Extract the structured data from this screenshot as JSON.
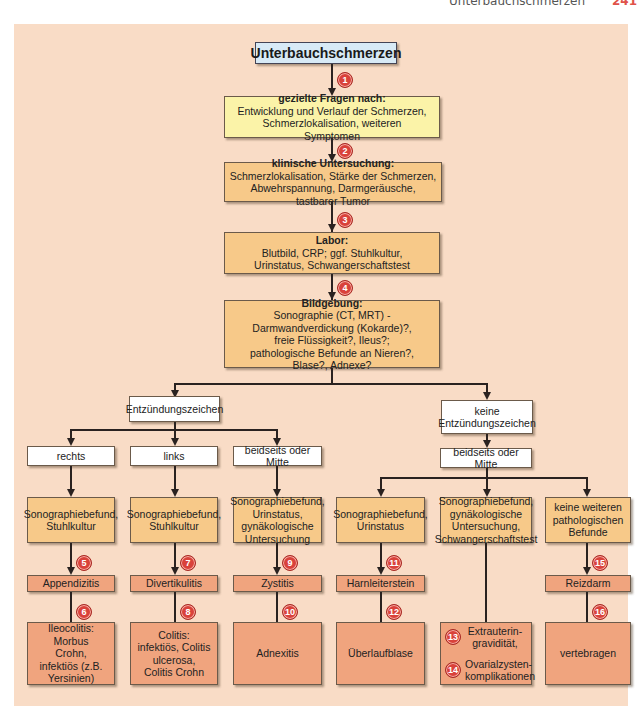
{
  "header": {
    "running_title": "Unterbauchschmerzen",
    "page_number": "241"
  },
  "flowchart": {
    "title": "Unterbauchschmerzen",
    "steps": [
      {
        "badge": "1",
        "heading": "gezielte Fragen nach:",
        "body": "Entwicklung und Verlauf der Schmerzen, Schmerzlokalisation, weiteren Symptomen"
      },
      {
        "badge": "2",
        "heading": "klinische Untersuchung:",
        "body": "Schmerzlokalisation, Stärke der Schmerzen, Abwehrspannung, Darmgeräusche, tastbarer Tumor"
      },
      {
        "badge": "3",
        "heading": "Labor:",
        "body": "Blutbild, CRP; ggf. Stuhlkultur, Urinstatus, Schwangerschaftstest"
      },
      {
        "badge": "4",
        "heading": "Bildgebung:",
        "body": "Sonographie (CT, MRT) - Darmwandverdickung (Kokarde)?, freie Flüssigkeit?, Ileus?; pathologische Befunde an Nieren?, Blase?, Adnexe?"
      }
    ],
    "branches": {
      "inflammation": "Entzündungszeichen",
      "no_inflammation": "keine Entzündungszeichen"
    },
    "locations": {
      "right": "rechts",
      "left": "links",
      "both_center_a": "beidseits oder Mitte",
      "both_center_b": "beidseits oder Mitte"
    },
    "findings": {
      "col1": "Sonographiebefund, Stuhlkultur",
      "col2": "Sonographiebefund, Stuhlkultur",
      "col3": "Sonographiebefund, Urinstatus, gynäkologische Untersuchung",
      "col4": "Sonographiebefund, Urinstatus",
      "col5": "Sonographiebefund, gynäkologische Untersuchung, Schwangerschaftstest",
      "col6": "keine weiteren pathologischen Befunde"
    },
    "diagnoses": {
      "col1": {
        "badge": "5",
        "label": "Appendizitis"
      },
      "col2": {
        "badge": "7",
        "label": "Divertikulitis"
      },
      "col3": {
        "badge": "9",
        "label": "Zystitis"
      },
      "col4": {
        "badge": "11",
        "label": "Harnleiterstein"
      },
      "col6": {
        "badge": "15",
        "label": "Reizdarm"
      }
    },
    "outcomes": {
      "col1": {
        "badge": "6",
        "label": "Ileocolitis: Morbus Crohn, infektiös (z.B. Yersinien)"
      },
      "col2": {
        "badge": "8",
        "label": "Colitis: infektiös, Colitis ulcerosa, Colitis Crohn"
      },
      "col3": {
        "badge": "10",
        "label": "Adnexitis"
      },
      "col4": {
        "badge": "12",
        "label": "Überlaufblase"
      },
      "col5": [
        {
          "badge": "13",
          "label": "Extrauterin-gravidität,"
        },
        {
          "badge": "14",
          "label": "Ovarialzysten-komplikationen"
        }
      ],
      "col6": {
        "badge": "16",
        "label": "vertebragen"
      }
    }
  }
}
